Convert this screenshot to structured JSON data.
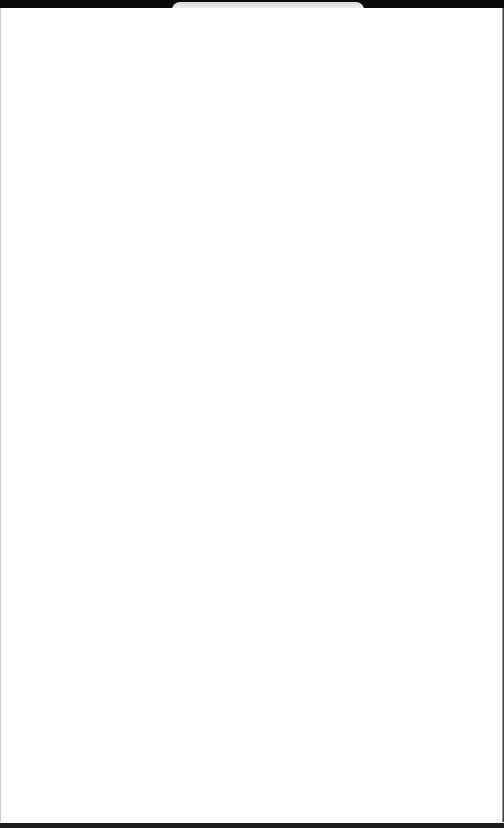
{
  "screen": {
    "state": "blank",
    "background_color": "#ffffff",
    "frame_color": "#0a0a0a"
  },
  "top_bar": {
    "notch": true
  },
  "content": {
    "text": ""
  }
}
